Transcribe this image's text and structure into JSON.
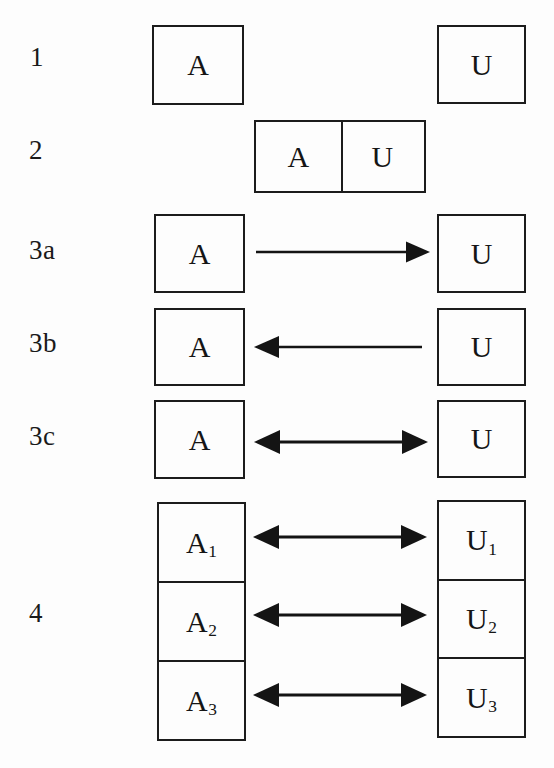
{
  "figure": {
    "background_color": "#fdfdfd",
    "ink_color": "#141414"
  },
  "rows": [
    {
      "id": "row-1",
      "label": "1",
      "left_box": "A",
      "right_box": "U",
      "connector": "none"
    },
    {
      "id": "row-2",
      "label": "2",
      "merged_box": {
        "left_cell": "A",
        "right_cell": "U"
      },
      "connector": "none"
    },
    {
      "id": "row-3a",
      "label": "3a",
      "left_box": "A",
      "right_box": "U",
      "connector": "arrow-right"
    },
    {
      "id": "row-3b",
      "label": "3b",
      "left_box": "A",
      "right_box": "U",
      "connector": "arrow-left"
    },
    {
      "id": "row-3c",
      "label": "3c",
      "left_box": "A",
      "right_box": "U",
      "connector": "arrow-both"
    },
    {
      "id": "row-4",
      "label": "4",
      "left_stack": [
        "A",
        "A",
        "A"
      ],
      "left_stack_subscripts": [
        "1",
        "2",
        "3"
      ],
      "right_stack": [
        "U",
        "U",
        "U"
      ],
      "right_stack_subscripts": [
        "1",
        "2",
        "3"
      ],
      "connector": "arrow-both",
      "connector_count": 3
    }
  ],
  "labels": {
    "row1": "1",
    "row2": "2",
    "row3a": "3a",
    "row3b": "3b",
    "row3c": "3c",
    "row4": "4"
  },
  "boxes": {
    "r1_a": "A",
    "r1_u": "U",
    "r2_a": "A",
    "r2_u": "U",
    "r3a_a": "A",
    "r3a_u": "U",
    "r3b_a": "A",
    "r3b_u": "U",
    "r3c_a": "A",
    "r3c_u": "U",
    "r4_a1_base": "A",
    "r4_a1_sub": "1",
    "r4_a2_base": "A",
    "r4_a2_sub": "2",
    "r4_a3_base": "A",
    "r4_a3_sub": "3",
    "r4_u1_base": "U",
    "r4_u1_sub": "1",
    "r4_u2_base": "U",
    "r4_u2_sub": "2",
    "r4_u3_base": "U",
    "r4_u3_sub": "3"
  }
}
